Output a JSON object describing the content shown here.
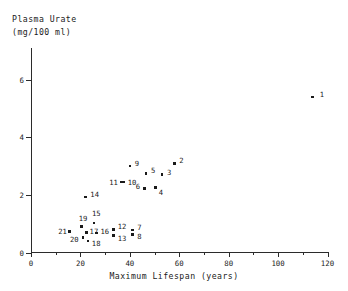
{
  "chart_data": {
    "type": "scatter",
    "title": "",
    "ylabel": "Plasma Urate (mg/100 ml)",
    "ylabel_line1": "Plasma Urate",
    "ylabel_line2": "(mg/100 ml)",
    "xlabel": "Maximum Lifespan (years)",
    "xlim": [
      0,
      120
    ],
    "ylim": [
      0,
      7.1
    ],
    "xticks": [
      0,
      20,
      40,
      60,
      80,
      100,
      120
    ],
    "xticks_minor": [
      10,
      30,
      50,
      70,
      90,
      110
    ],
    "yticks": [
      0,
      2,
      4,
      6
    ],
    "grid": false,
    "legend": "none",
    "point_label_position": "right",
    "points": [
      {
        "label": "1",
        "x": 114.0,
        "y": 5.4,
        "lx": 7,
        "ly": -4
      },
      {
        "label": "2",
        "x": 58.0,
        "y": 3.1,
        "lx": 5,
        "ly": -4
      },
      {
        "label": "3",
        "x": 53.0,
        "y": 2.7,
        "lx": 5,
        "ly": -4
      },
      {
        "label": "4",
        "x": 50.5,
        "y": 2.25,
        "lx": 3,
        "ly": 3
      },
      {
        "label": "5",
        "x": 46.5,
        "y": 2.75,
        "lx": 5,
        "ly": -4
      },
      {
        "label": "6",
        "x": 46.0,
        "y": 2.22,
        "lx": -9,
        "ly": -4
      },
      {
        "label": "7",
        "x": 41.0,
        "y": 0.78,
        "lx": 5,
        "ly": -4
      },
      {
        "label": "8",
        "x": 41.0,
        "y": 0.62,
        "lx": 5,
        "ly": 0
      },
      {
        "label": "9",
        "x": 40.0,
        "y": 3.0,
        "lx": 5,
        "ly": -4
      },
      {
        "label": "10",
        "x": 37.5,
        "y": 2.45,
        "lx": 4,
        "ly": -1
      },
      {
        "label": "11",
        "x": 36.5,
        "y": 2.45,
        "lx": -12,
        "ly": -1
      },
      {
        "label": "12",
        "x": 33.5,
        "y": 0.8,
        "lx": 4,
        "ly": -4
      },
      {
        "label": "13",
        "x": 33.5,
        "y": 0.58,
        "lx": 4,
        "ly": 1
      },
      {
        "label": "14",
        "x": 22.0,
        "y": 1.93,
        "lx": 5,
        "ly": -4
      },
      {
        "label": "15",
        "x": 25.5,
        "y": 1.02,
        "lx": -2,
        "ly": -11
      },
      {
        "label": "16",
        "x": 26.5,
        "y": 0.68,
        "lx": 4,
        "ly": -3
      },
      {
        "label": "17",
        "x": 22.5,
        "y": 0.7,
        "lx": 3,
        "ly": -2
      },
      {
        "label": "18",
        "x": 23.0,
        "y": 0.4,
        "lx": 4,
        "ly": 1
      },
      {
        "label": "19",
        "x": 20.5,
        "y": 0.9,
        "lx": -3,
        "ly": -10
      },
      {
        "label": "20",
        "x": 21.0,
        "y": 0.52,
        "lx": -13,
        "ly": 0
      },
      {
        "label": "21",
        "x": 15.5,
        "y": 0.72,
        "lx": -11,
        "ly": -2
      }
    ]
  }
}
